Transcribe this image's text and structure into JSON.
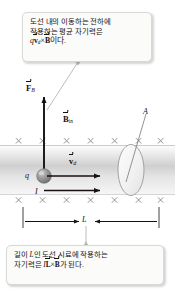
{
  "figure": {
    "colors": {
      "ink": "#14110f",
      "field_mark": "#8e8e8e",
      "wire_band": "#d9d9d9",
      "bubble_fill": "#fbfbfa",
      "bubble_border": "#d8d8d4",
      "leader": "#b9b9b5"
    }
  },
  "callout_top": {
    "name": "force-on-moving-charge-callout",
    "lines": [
      "도선 내의 이동하는 전하에",
      "작용하는 평균 자기력은"
    ],
    "formula": {
      "charge": "q",
      "vector_v": "v",
      "v_subscript": "d",
      "cross": "×",
      "vector_B": "B",
      "tail_text": "이다."
    }
  },
  "callout_bottom": {
    "name": "force-on-wire-segment-callout",
    "line1_pre": "길이 ",
    "line1_len": "L",
    "line1_post": "인 도선 시료에 작용하는",
    "line2_pre": "자기력은 ",
    "formula": {
      "current": "I",
      "vector_L": "L",
      "cross": "×",
      "vector_B": "B"
    },
    "line2_post": "가 된다."
  },
  "diagram": {
    "force_label": {
      "symbol": "F",
      "subscript": "B"
    },
    "field_label": {
      "symbol": "B",
      "subscript": "in"
    },
    "drift_velocity_label": {
      "symbol": "v",
      "subscript": "d"
    },
    "charge_label": "q",
    "current_label": "I",
    "area_label": "A",
    "length_label": "L",
    "field_direction": "into-page",
    "field_mark_glyph": "×",
    "field_mark_rows": 2,
    "field_marks_per_row": 6
  }
}
